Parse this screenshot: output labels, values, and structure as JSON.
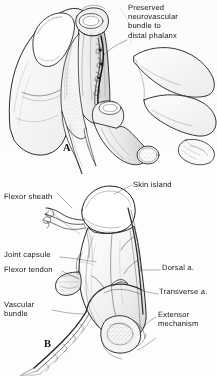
{
  "figure": {
    "background_color": "#fdfdfd",
    "ink_color": "#1c1c1e",
    "width": 217,
    "height": 376
  },
  "panel_a": {
    "letter": "A",
    "caption": "Dissected finger held between thumb and index finger showing preserved neurovascular bundle",
    "labels": [
      {
        "id": "preserved-bundle",
        "text": "Preserved\nneurovascular\nbundle to\ndistal phalanx",
        "lines": [
          "Preserved",
          "neurovascular",
          "bundle to",
          "distal phalanx"
        ],
        "x": 128,
        "y": 3
      }
    ]
  },
  "panel_b": {
    "letter": "B",
    "caption": "Isolated island flap on its vascular pedicle showing component structures",
    "labels": [
      {
        "id": "flexor-sheath",
        "text": "Flexor sheath",
        "x": 4,
        "y": 192,
        "align": "left"
      },
      {
        "id": "skin-island",
        "text": "Skin island",
        "x": 133,
        "y": 180,
        "align": "left"
      },
      {
        "id": "joint-capsule",
        "text": "Joint capsule",
        "x": 4,
        "y": 250,
        "align": "left"
      },
      {
        "id": "flexor-tendon",
        "text": "Flexor tendon",
        "x": 4,
        "y": 265,
        "align": "left"
      },
      {
        "id": "dorsal-artery",
        "text": "Dorsal a.",
        "x": 162,
        "y": 263,
        "align": "left"
      },
      {
        "id": "transverse-artery",
        "text": "Transverse a.",
        "x": 160,
        "y": 287,
        "align": "left"
      },
      {
        "id": "vascular-bundle",
        "text": "Vascular\nbundle",
        "lines": [
          "Vascular",
          "bundle"
        ],
        "x": 4,
        "y": 300,
        "align": "left"
      },
      {
        "id": "extensor-mechanism",
        "text": "Extensor\nmechanism",
        "lines": [
          "Extensor",
          "mechanism"
        ],
        "x": 158,
        "y": 310,
        "align": "left"
      }
    ]
  }
}
